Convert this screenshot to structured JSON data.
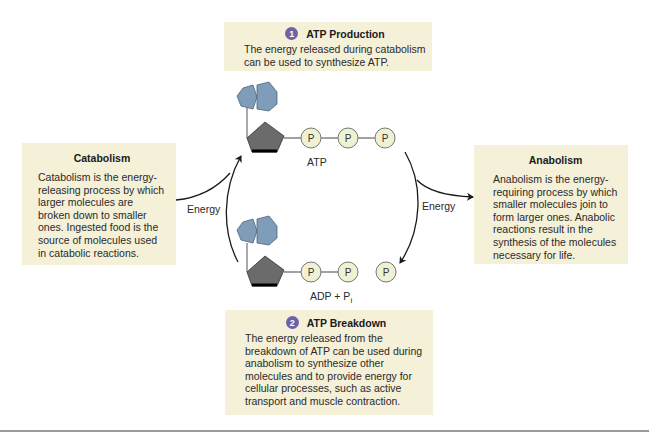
{
  "production": {
    "step": "1",
    "title": "ATP Production",
    "text": "The energy released during catabolism can be used to synthesize ATP."
  },
  "breakdown": {
    "step": "2",
    "title": "ATP Breakdown",
    "text": "The energy released from the breakdown of ATP can be used during anabolism to synthesize other molecules and to provide energy for cellular processes, such as active transport and muscle contraction."
  },
  "catabolism": {
    "title": "Catabolism",
    "text": "Catabolism is the energy-releasing process by which larger molecules are broken down to smaller ones. Ingested food is the source of molecules used in catabolic reactions."
  },
  "anabolism": {
    "title": "Anabolism",
    "text": "Anabolism is the energy-requiring process by which smaller molecules join to form larger ones. Anabolic reactions result in the synthesis of the molecules necessary for life."
  },
  "molecules": {
    "atp_label": "ATP",
    "adp_label": "ADP + P",
    "adp_subscript": "i",
    "phosphate_symbol": "P"
  },
  "arrows": {
    "energy_left": "Energy",
    "energy_right": "Energy"
  },
  "colors": {
    "box_bg": "#f5f0d8",
    "step_badge": "#6d63a3",
    "adenine": "#7f9db8",
    "ribose": "#6b6b6b",
    "phosphate_fill": "#eef2d2"
  }
}
